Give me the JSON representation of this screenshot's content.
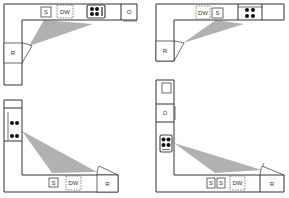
{
  "figure": {
    "colors": {
      "work_triangle": "#a9a9a9",
      "lines": "#333333",
      "burners": "#111111"
    },
    "plans": [
      {
        "id": "top-left",
        "labels": {
          "sink": "S",
          "dishwasher": "DW",
          "oven": "O",
          "refrigerator": "R"
        }
      },
      {
        "id": "top-right",
        "labels": {
          "dishwasher": "DW",
          "sink": "S",
          "refrigerator": "R"
        }
      },
      {
        "id": "bottom-left",
        "labels": {
          "sink": "S",
          "dishwasher": "DW",
          "refrigerator": "R"
        }
      },
      {
        "id": "bottom-right",
        "labels": {
          "oven": "O",
          "sink_1": "S",
          "sink_2": "S",
          "dishwasher": "DW",
          "refrigerator": "R"
        }
      }
    ]
  }
}
